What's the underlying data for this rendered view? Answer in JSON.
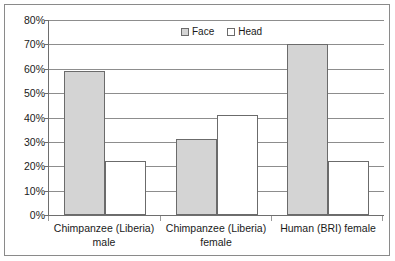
{
  "chart_data": {
    "type": "bar",
    "title": "",
    "subtitle": "",
    "xlabel": "",
    "ylabel": "",
    "ylim": [
      0,
      80
    ],
    "ytick_labels": [
      "80%",
      "70%",
      "60%",
      "50%",
      "40%",
      "30%",
      "20%",
      "10%",
      "0%"
    ],
    "ytick_values": [
      80,
      70,
      60,
      50,
      40,
      30,
      20,
      10,
      0
    ],
    "grid": true,
    "legend_position": "top-center",
    "categories": [
      "Chimpanzee (Liberia) male",
      "Chimpanzee (Liberia) female",
      "Human (BRI) female"
    ],
    "category_lines": [
      {
        "line1": "Chimpanzee (Liberia)",
        "line2": "male"
      },
      {
        "line1": "Chimpanzee (Liberia)",
        "line2": "female"
      },
      {
        "line1": "Human (BRI) female",
        "line2": ""
      }
    ],
    "series": [
      {
        "name": "Face",
        "color": "#d4d4d4",
        "values": [
          59,
          31,
          70
        ]
      },
      {
        "name": "Head",
        "color": "#ffffff",
        "values": [
          22,
          41,
          22
        ]
      }
    ]
  },
  "legend": {
    "items": [
      {
        "label": "Face",
        "swatch": "face-swatch"
      },
      {
        "label": "Head",
        "swatch": "head-swatch"
      }
    ]
  },
  "colors": {
    "face_fill": "#d4d4d4",
    "head_fill": "#ffffff",
    "bar_border": "#6b6b6b",
    "gridline": "#8d8d8d",
    "axis": "#6e6e6e",
    "frame": "#8a8a8a",
    "text": "#1a1a1a",
    "background": "#ffffff"
  }
}
